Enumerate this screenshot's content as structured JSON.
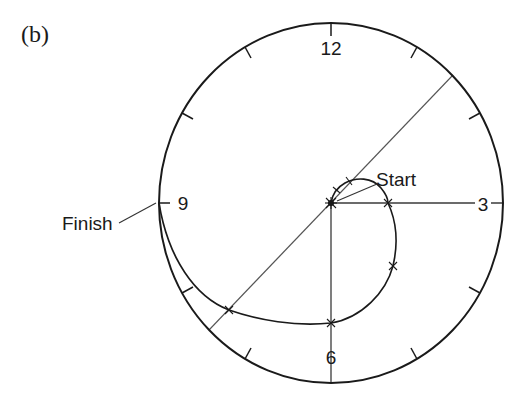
{
  "figure": {
    "panel_label": "(b)",
    "type": "clock-dial trajectory diagram",
    "dial": {
      "hour_labels": {
        "twelve": "12",
        "three": "3",
        "six": "6",
        "nine": "9"
      },
      "tick_hours": [
        1,
        2,
        4,
        5,
        7,
        8,
        10,
        11
      ]
    },
    "annotations": {
      "start": "Start",
      "finish": "Finish"
    },
    "colors": {
      "stroke": "#1a1a1a",
      "guide": "#4a4a4a",
      "background": "#ffffff"
    },
    "trajectory": {
      "description": "Spiral path starting at dial centre (Start), sweeping clockwise outward past 3 and 6 and ending on the rim at 9 (Finish)",
      "marker_count": 6
    }
  }
}
